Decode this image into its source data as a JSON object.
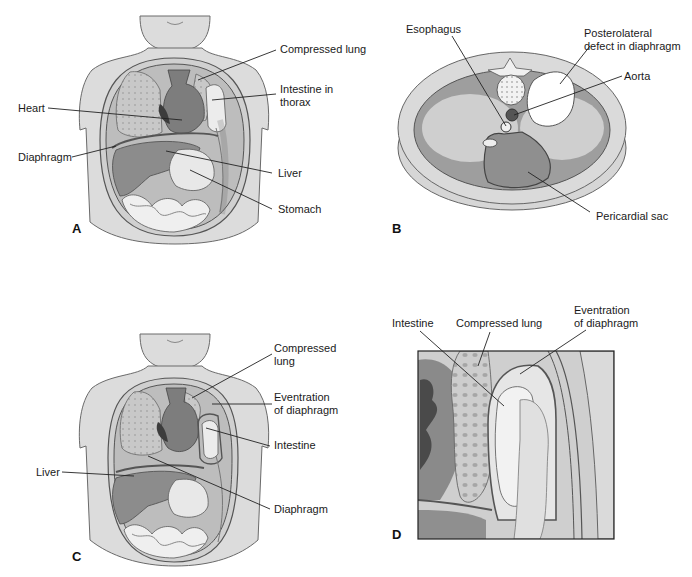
{
  "figure": {
    "colors": {
      "background": "#ffffff",
      "skin": "#d9d9d9",
      "outline": "#555555",
      "lung": "#c4c4c4",
      "heart": "#7a7a7a",
      "heart_dark": "#3c3c3c",
      "liver": "#8c8c8c",
      "stomach": "#e6e6e6",
      "intestine": "#ededed",
      "cavity_dark": "#9a9a9a",
      "cavity_light": "#cfcfcf",
      "aorta": "#555555",
      "leader": "#222222",
      "text": "#1a1a1a"
    },
    "panels": [
      {
        "id": "A",
        "letter": "A",
        "view": "frontal torso",
        "labels": {
          "compressed_lung": "Compressed lung",
          "intestine_in_thorax_1": "Intestine in",
          "intestine_in_thorax_2": "thorax",
          "heart": "Heart",
          "diaphragm": "Diaphragm",
          "liver": "Liver",
          "stomach": "Stomach"
        }
      },
      {
        "id": "B",
        "letter": "B",
        "view": "axial cross-section",
        "labels": {
          "esophagus": "Esophagus",
          "posterolateral_1": "Posterolateral",
          "posterolateral_2": "defect in diaphragm",
          "aorta": "Aorta",
          "pericardial_sac": "Pericardial sac"
        }
      },
      {
        "id": "C",
        "letter": "C",
        "view": "frontal torso",
        "labels": {
          "compressed_lung_1": "Compressed",
          "compressed_lung_2": "lung",
          "eventration_1": "Eventration",
          "eventration_2": "of diaphragm",
          "intestine": "Intestine",
          "liver": "Liver",
          "diaphragm": "Diaphragm"
        }
      },
      {
        "id": "D",
        "letter": "D",
        "view": "close-up",
        "labels": {
          "intestine": "Intestine",
          "compressed_lung": "Compressed lung",
          "eventration_1": "Eventration",
          "eventration_2": "of diaphragm"
        }
      }
    ]
  }
}
